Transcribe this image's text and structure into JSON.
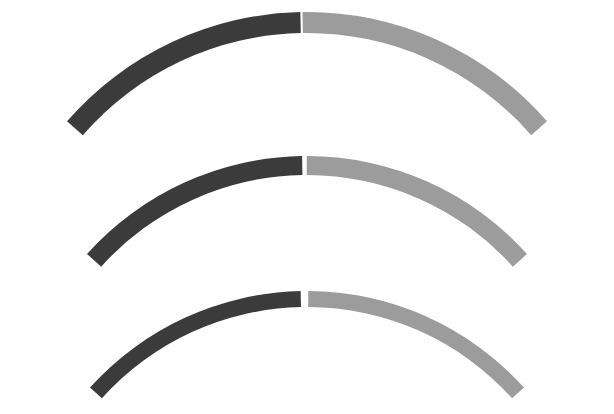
{
  "canvas": {
    "width": 614,
    "height": 414,
    "background": "#ffffff"
  },
  "figure": {
    "title": "",
    "arc_count": 3
  },
  "palette": {
    "dark": "#3b3b3b",
    "light": "#9c9c9c",
    "background": "#ffffff",
    "gap": "#ffffff"
  },
  "chart_data": {
    "type": "pie",
    "title": "",
    "xlabel": "",
    "ylabel": "",
    "legend_position": "none",
    "grid": false,
    "arcs": [
      {
        "name": "arc-outer",
        "center_x": 307,
        "center_y": 330,
        "outer_radius": 318,
        "inner_radius": 297,
        "thickness": 21,
        "start_angle_deg": 221,
        "end_angle_deg": 319,
        "split_angle_deg": 269,
        "gap_deg": 0.4,
        "apex_top_y": 14,
        "apex_bottom_y": 35,
        "left_end_x": 20,
        "right_end_x": 596,
        "segments": [
          {
            "name": "dark-left",
            "color": "#3b3b3b",
            "share": 0.49
          },
          {
            "name": "light-right",
            "color": "#9c9c9c",
            "share": 0.51
          }
        ]
      },
      {
        "name": "arc-middle",
        "center_x": 307,
        "center_y": 452,
        "outer_radius": 296,
        "inner_radius": 277,
        "thickness": 19,
        "start_angle_deg": 222,
        "end_angle_deg": 318,
        "split_angle_deg": 269.5,
        "gap_deg": 0.9,
        "apex_top_y": 156,
        "apex_bottom_y": 175,
        "left_end_x": 23,
        "right_end_x": 589,
        "segments": [
          {
            "name": "dark-left",
            "color": "#3b3b3b",
            "share": 0.49
          },
          {
            "name": "light-right",
            "color": "#9c9c9c",
            "share": 0.51
          }
        ]
      },
      {
        "name": "arc-inner",
        "center_x": 307,
        "center_y": 583,
        "outer_radius": 292,
        "inner_radius": 276,
        "thickness": 16,
        "start_angle_deg": 222,
        "end_angle_deg": 318,
        "split_angle_deg": 269.5,
        "gap_deg": 1.5,
        "apex_top_y": 291,
        "apex_bottom_y": 307,
        "left_end_x": 22,
        "right_end_x": 592,
        "segments": [
          {
            "name": "dark-left",
            "color": "#3b3b3b",
            "share": 0.49
          },
          {
            "name": "light-right",
            "color": "#9c9c9c",
            "share": 0.51
          }
        ]
      }
    ]
  }
}
